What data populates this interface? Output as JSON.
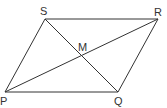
{
  "diagram": {
    "type": "parallelogram-with-diagonals",
    "line_color": "#333333",
    "vertices": {
      "P": {
        "label": "P",
        "x": 5,
        "y": 92
      },
      "Q": {
        "label": "Q",
        "x": 118,
        "y": 92
      },
      "R": {
        "label": "R",
        "x": 158,
        "y": 19
      },
      "S": {
        "label": "S",
        "x": 45,
        "y": 19
      }
    },
    "intersection": {
      "label": "M",
      "x": 82,
      "y": 56
    },
    "edges": [
      "PQ",
      "QR",
      "RS",
      "SP"
    ],
    "diagonals": [
      "PR",
      "SQ"
    ]
  }
}
